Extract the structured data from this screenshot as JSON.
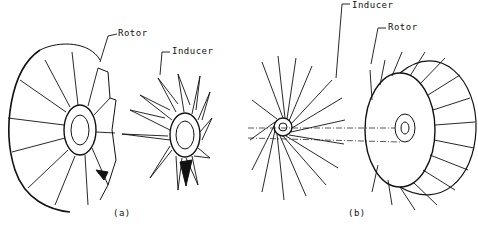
{
  "figure": {
    "panels": [
      {
        "id": "a",
        "caption": "(a)",
        "labels": {
          "rotor": "Rotor",
          "inducer": "Inducer"
        }
      },
      {
        "id": "b",
        "caption": "(b)",
        "labels": {
          "inducer": "Inducer",
          "rotor": "Rotor"
        }
      }
    ],
    "colors": {
      "line": "#111111",
      "background": "#ffffff"
    }
  }
}
